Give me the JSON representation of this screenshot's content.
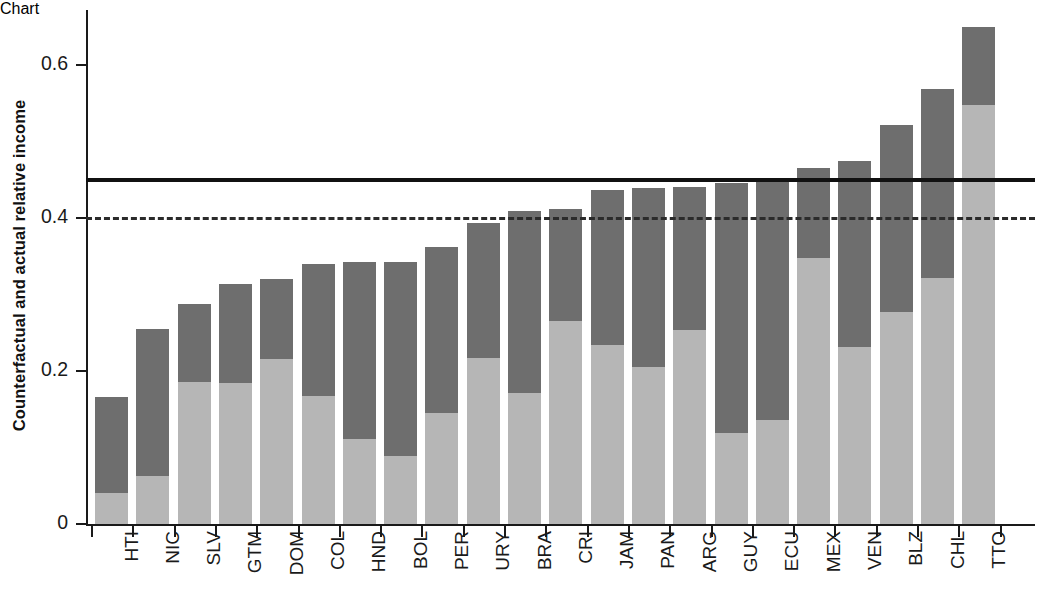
{
  "chart": {
    "type": "bar",
    "ylabel": "Counterfactual and actual relative income",
    "xlabel": "",
    "title": ""
  },
  "axis": {
    "y_ticks": [
      "0",
      "0.2",
      "0.4",
      "0.6"
    ],
    "y_tick_values": [
      0,
      0.2,
      0.4,
      0.6
    ],
    "y_min": 0,
    "y_max": 0.69
  },
  "legend": {
    "series_actual": "Actual relative income",
    "series_counterfactual": "Counterfactual relative income",
    "color_actual": "#b6b6b6",
    "color_counterfactual": "#6e6e6e",
    "color_solid_line": "#111111",
    "color_dashed_line": "#2b2b2b"
  },
  "reference_lines": [
    {
      "name": "solid-reference-line",
      "style": "solid",
      "value": 0.452
    },
    {
      "name": "dashed-reference-line",
      "style": "dashed",
      "value": 0.401
    }
  ],
  "chart_data": {
    "type": "bar",
    "stacked": true,
    "title": "",
    "xlabel": "",
    "ylabel": "Counterfactual and actual relative income",
    "ylim": [
      0,
      0.69
    ],
    "grid": false,
    "legend_position": "none",
    "categories": [
      "HTI",
      "NIC",
      "SLV",
      "GTM",
      "DOM",
      "COL",
      "HND",
      "BOL",
      "PER",
      "URY",
      "BRA",
      "CRI",
      "JAM",
      "PAN",
      "ARG",
      "GUY",
      "ECU",
      "MEX",
      "VEN",
      "BLZ",
      "CHL",
      "TTO"
    ],
    "series": [
      {
        "name": "Actual relative income",
        "color": "#b6b6b6",
        "values": [
          0.04,
          0.063,
          0.186,
          0.184,
          0.216,
          0.167,
          0.111,
          0.089,
          0.145,
          0.217,
          0.171,
          0.265,
          0.234,
          0.205,
          0.253,
          0.119,
          0.136,
          0.348,
          0.231,
          0.277,
          0.322,
          0.548
        ]
      },
      {
        "name": "Counterfactual relative income",
        "color": "#6e6e6e",
        "values": [
          0.166,
          0.255,
          0.288,
          0.314,
          0.32,
          0.34,
          0.342,
          0.342,
          0.362,
          0.394,
          0.409,
          0.412,
          0.437,
          0.439,
          0.441,
          0.446,
          0.447,
          0.465,
          0.475,
          0.522,
          0.569,
          0.65
        ]
      }
    ],
    "reference_lines": [
      {
        "style": "solid",
        "value": 0.452
      },
      {
        "style": "dashed",
        "value": 0.401
      }
    ]
  }
}
